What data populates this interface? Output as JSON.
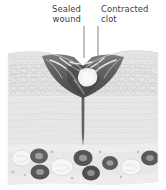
{
  "figure": {
    "name": "skin-wound-healing-cross-section",
    "width": 166,
    "height": 190,
    "background_color": "#ffffff"
  },
  "labels": [
    {
      "id": "sealed-wound",
      "line1": "Sealed",
      "line2": "wound",
      "leader_line_x": 84,
      "leader_line_top": 26,
      "leader_line_bottom": 57,
      "color": "#3c3c3c"
    },
    {
      "id": "contracted-clot",
      "line1": "Contracted",
      "line2": "clot",
      "leader_line_x": 98,
      "leader_line_top": 26,
      "leader_line_bottom": 70,
      "color": "#3c3c3c"
    }
  ],
  "anatomy": {
    "layers": [
      {
        "name": "epidermis",
        "label": "Epidermis",
        "fill": "#e4e4e4",
        "top": 52,
        "bottom": 96
      },
      {
        "name": "dermis",
        "label": "Dermis",
        "fill": "#e9e9e9",
        "top": 96,
        "bottom": 142
      },
      {
        "name": "hypodermis",
        "label": "Subcutaneous fat",
        "fill": "#e3e3e3",
        "top": 142,
        "bottom": 182
      }
    ],
    "scab": {
      "name": "scab-clot",
      "fill": "#6d6d6d",
      "fill_dark": "#4a4a4a",
      "highlight": "#f2f2f2"
    },
    "contracted_clot_patch": {
      "name": "contracted-clot-patch",
      "fill": "#f0f0f0"
    },
    "wound_channel": {
      "name": "wound-channel",
      "fill": "#6a6a6a",
      "top": 96,
      "bottom": 145
    },
    "adipocytes_light_fill": "#f4f4f4",
    "adipocytes_dark_fill": "#636363",
    "cell_outline": "#cfcfcf"
  },
  "colors": {
    "text": "#3c3c3c",
    "leader": "#8a8a8a",
    "background": "#ffffff"
  }
}
